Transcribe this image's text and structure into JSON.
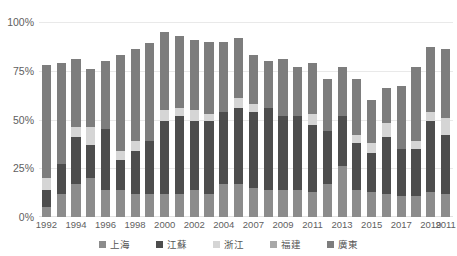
{
  "chart_data": {
    "type": "bar",
    "stacked": true,
    "title": "",
    "subtitle": "",
    "xlabel": "",
    "ylabel": "",
    "ylim": [
      0,
      100
    ],
    "ytick_labels": [
      "0%",
      "25%",
      "50%",
      "75%",
      "100%"
    ],
    "ytick_values": [
      0,
      25,
      50,
      75,
      100
    ],
    "grid": true,
    "legend_position": "bottom",
    "categories": [
      "1992",
      "1993",
      "1994",
      "1995",
      "1996",
      "1997",
      "1998",
      "1999",
      "2000",
      "2001",
      "2002",
      "2003",
      "2004",
      "2005",
      "2007",
      "2008",
      "2009",
      "2010",
      "2011",
      "2012",
      "2013",
      "2014",
      "2015",
      "2016",
      "2017",
      "2018",
      "2019",
      "2011"
    ],
    "xtick_labels": [
      "1992",
      "1994",
      "1996",
      "1998",
      "2000",
      "2002",
      "2004",
      "2007",
      "2009",
      "2011",
      "2013",
      "2015",
      "2017",
      "2019",
      "2011"
    ],
    "xtick_indices": [
      0,
      2,
      4,
      6,
      8,
      10,
      12,
      14,
      16,
      18,
      20,
      22,
      24,
      26,
      27
    ],
    "series": [
      {
        "name": "上海",
        "color": "#8c8c8c",
        "values": [
          5,
          12,
          17,
          20,
          14,
          14,
          12,
          12,
          12,
          12,
          14,
          12,
          17,
          17,
          15,
          14,
          14,
          14,
          13,
          17,
          26,
          14,
          13,
          12,
          11,
          11,
          13,
          12
        ]
      },
      {
        "name": "江蘇",
        "color": "#4d4d4d",
        "values": [
          9,
          15,
          24,
          17,
          31,
          15,
          22,
          27,
          37,
          40,
          35,
          37,
          37,
          39,
          39,
          42,
          38,
          38,
          34,
          27,
          26,
          24,
          20,
          29,
          24,
          24,
          36,
          30
        ]
      },
      {
        "name": "浙江",
        "color": "#d5d5d5",
        "values": [
          6,
          0,
          5,
          9,
          0,
          5,
          5,
          0,
          6,
          4,
          6,
          4,
          0,
          5,
          4,
          0,
          0,
          0,
          6,
          0,
          0,
          4,
          5,
          7,
          0,
          4,
          5,
          9
        ]
      },
      {
        "name": "福建",
        "color": "#a8a8a8",
        "values": [
          0,
          0,
          0,
          0,
          0,
          0,
          0,
          0,
          0,
          0,
          0,
          0,
          0,
          0,
          0,
          0,
          0,
          0,
          0,
          0,
          0,
          0,
          0,
          0,
          0,
          0,
          0,
          0
        ]
      },
      {
        "name": "廣東",
        "color": "#7d7d7d",
        "values": [
          58,
          52,
          35,
          30,
          35,
          49,
          47,
          50,
          40,
          37,
          36,
          37,
          36,
          31,
          25,
          24,
          29,
          25,
          26,
          27,
          25,
          29,
          22,
          18,
          32,
          38,
          33,
          35
        ]
      }
    ],
    "totals": [
      78,
      79,
      81,
      76,
      80,
      83,
      86,
      89,
      95,
      93,
      91,
      90,
      90,
      92,
      83,
      82,
      81,
      79,
      73,
      71,
      71,
      60,
      66,
      67,
      77,
      77,
      87,
      76
    ]
  },
  "colors": {
    "background": "#ffffff",
    "grid": "#e9e9e9",
    "axis_text": "#5f5f5f",
    "legend_text": "#555555"
  }
}
